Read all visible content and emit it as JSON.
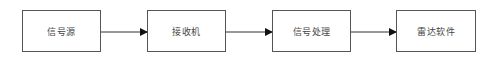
{
  "diagram": {
    "type": "flowchart",
    "direction": "left-to-right",
    "nodes": [
      {
        "id": "n1",
        "label": "信号源"
      },
      {
        "id": "n2",
        "label": "接收机"
      },
      {
        "id": "n3",
        "label": "信号处理"
      },
      {
        "id": "n4",
        "label": "雷达软件"
      }
    ],
    "edges": [
      {
        "from": "n1",
        "to": "n2"
      },
      {
        "from": "n2",
        "to": "n3"
      },
      {
        "from": "n3",
        "to": "n4"
      }
    ],
    "colors": {
      "stroke": "#555555",
      "text": "#444444",
      "arrow": "#111111"
    }
  }
}
